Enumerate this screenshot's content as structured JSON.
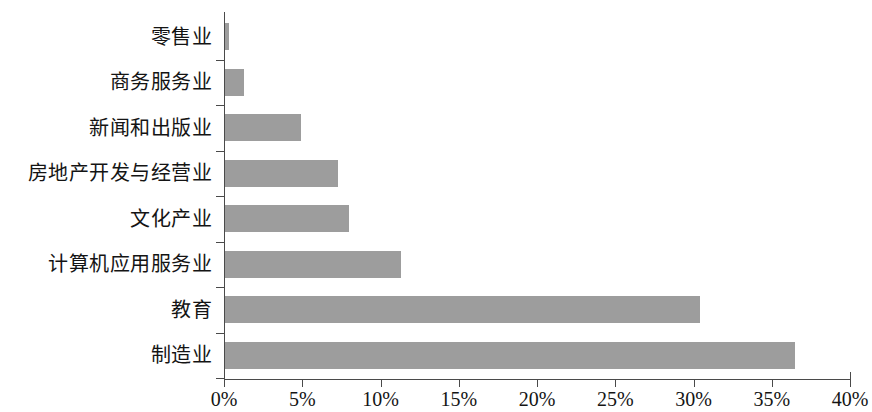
{
  "chart_data": {
    "type": "bar",
    "orientation": "horizontal",
    "title": "",
    "subtitle": "",
    "xlabel": "",
    "ylabel": "",
    "categories": [
      "零售业",
      "商务服务业",
      "新闻和出版业",
      "房地产开发与经营业",
      "文化产业",
      "计算机应用服务业",
      "教育",
      "制造业"
    ],
    "values": [
      0.3,
      1.3,
      4.9,
      7.3,
      8.0,
      11.3,
      30.4,
      36.5
    ],
    "value_unit": "%",
    "xlim": [
      0,
      40
    ],
    "xticks": [
      0,
      5,
      10,
      15,
      20,
      25,
      30,
      35,
      40
    ],
    "xtick_labels": [
      "0%",
      "5%",
      "10%",
      "15%",
      "20%",
      "25%",
      "30%",
      "35%",
      "40%"
    ],
    "grid": false,
    "legend": null,
    "bar_color": "#9d9d9d",
    "axis_color": "#4a4a4a",
    "text_color": "#141414",
    "category_order": "top-to-bottom-ascending"
  }
}
